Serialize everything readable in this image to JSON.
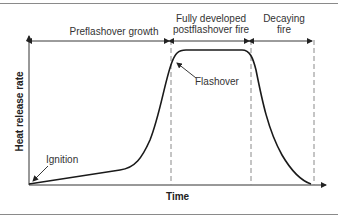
{
  "diagram": {
    "x_axis_label": "Time",
    "y_axis_label": "Heat release rate",
    "phases": [
      {
        "label_line1": "Preflashover growth",
        "label_line2": ""
      },
      {
        "label_line1": "Fully developed",
        "label_line2": "postflashover fire"
      },
      {
        "label_line1": "Decaying",
        "label_line2": "fire"
      }
    ],
    "annotations": {
      "ignition": "Ignition",
      "flashover": "Flashover"
    },
    "colors": {
      "curve": "#1a1a1a",
      "axes": "#333333",
      "dashed": "#8a8a8a",
      "rule": "#8a8a8a"
    }
  }
}
